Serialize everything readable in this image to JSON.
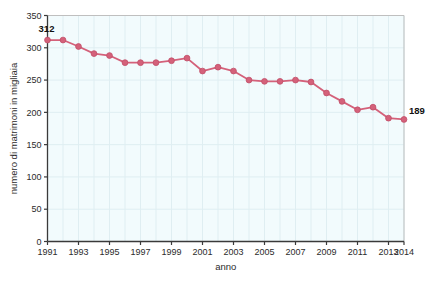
{
  "chart_data": {
    "type": "line",
    "title": "",
    "xlabel": "anno",
    "ylabel": "numero di matrimoni in migliaia",
    "xlim": [
      1991,
      2014
    ],
    "ylim": [
      0,
      350
    ],
    "grid": true,
    "legend": "none",
    "series_color": "#d4617a",
    "x": [
      1991,
      1992,
      1993,
      1994,
      1995,
      1996,
      1997,
      1998,
      1999,
      2000,
      2001,
      2002,
      2003,
      2004,
      2005,
      2006,
      2007,
      2008,
      2009,
      2010,
      2011,
      2012,
      2013,
      2014
    ],
    "values": [
      312,
      312,
      302,
      291,
      288,
      277,
      277,
      277,
      280,
      284,
      264,
      270,
      264,
      250,
      248,
      248,
      250,
      247,
      230,
      217,
      204,
      208,
      191,
      189
    ],
    "yticks": [
      0,
      50,
      100,
      150,
      200,
      250,
      300,
      350
    ],
    "ytick_labels": [
      "0",
      "50",
      "100",
      "150",
      "200",
      "250",
      "300",
      "350"
    ],
    "xticks": [
      1991,
      1993,
      1995,
      1997,
      1999,
      2001,
      2003,
      2005,
      2007,
      2009,
      2011,
      2013,
      2014
    ],
    "xtick_labels": [
      "1991",
      "1993",
      "1995",
      "1997",
      "1999",
      "2001",
      "2003",
      "2005",
      "2007",
      "2009",
      "2011",
      "2013",
      "2014"
    ],
    "annotations": [
      {
        "text": "312",
        "x": 1991,
        "y": 312
      },
      {
        "text": "189",
        "x": 2014,
        "y": 189
      }
    ],
    "plot_background": "#f2fbfd",
    "gridline_color": "#dfeef2"
  }
}
